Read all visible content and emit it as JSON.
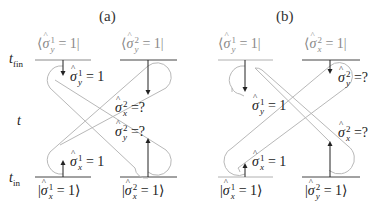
{
  "figure": {
    "panels": [
      {
        "id": "a",
        "title": "(a)",
        "time_labels": {
          "final": "t",
          "final_sub": "fin",
          "middle": "t",
          "initial": "t",
          "initial_sub": "in"
        },
        "top_states": [
          {
            "bra_open": "⟨",
            "op": "σ",
            "sup": "1",
            "sub": "y",
            "rest": " = 1|"
          },
          {
            "bra_open": "⟨",
            "op": "σ",
            "sup": "2",
            "sub": "y",
            "rest": " = 1|"
          }
        ],
        "bottom_states": [
          {
            "ket_open": "|",
            "op": "σ",
            "sup": "1",
            "sub": "x",
            "rest": " = 1⟩"
          },
          {
            "ket_open": "|",
            "op": "σ",
            "sup": "2",
            "sub": "x",
            "rest": " = 1⟩"
          }
        ],
        "annotations": [
          {
            "op": "σ",
            "sup": "1",
            "sub": "y",
            "rest": " = 1"
          },
          {
            "op": "σ",
            "sup": "2",
            "sub": "x",
            "rest": " =?"
          },
          {
            "op": "σ",
            "sup": "2",
            "sub": "y",
            "rest": " =?"
          },
          {
            "op": "σ",
            "sup": "1",
            "sub": "x",
            "rest": " = 1"
          }
        ]
      },
      {
        "id": "b",
        "title": "(b)",
        "top_states": [
          {
            "bra_open": "⟨",
            "op": "σ",
            "sup": "1",
            "sub": "y",
            "rest": " = 1|"
          },
          {
            "bra_open": "⟨",
            "op": "σ",
            "sup": "2",
            "sub": "x",
            "rest": " = 1|"
          }
        ],
        "bottom_states": [
          {
            "ket_open": "|",
            "op": "σ",
            "sup": "1",
            "sub": "x",
            "rest": " = 1⟩"
          },
          {
            "ket_open": "|",
            "op": "σ",
            "sup": "2",
            "sub": "y",
            "rest": " = 1⟩"
          }
        ],
        "annotations": [
          {
            "op": "σ",
            "sup": "2",
            "sub": "y",
            "rest": " =?"
          },
          {
            "op": "σ",
            "sup": "1",
            "sub": "y",
            "rest": " = 1"
          },
          {
            "op": "σ",
            "sup": "2",
            "sub": "x",
            "rest": " =?"
          },
          {
            "op": "σ",
            "sup": "1",
            "sub": "x",
            "rest": " = 1"
          }
        ]
      }
    ],
    "colors": {
      "loop": "#b8b8b8",
      "line": "#333333",
      "gray_text": "#8a8a8a",
      "arrow": "#222222"
    }
  }
}
